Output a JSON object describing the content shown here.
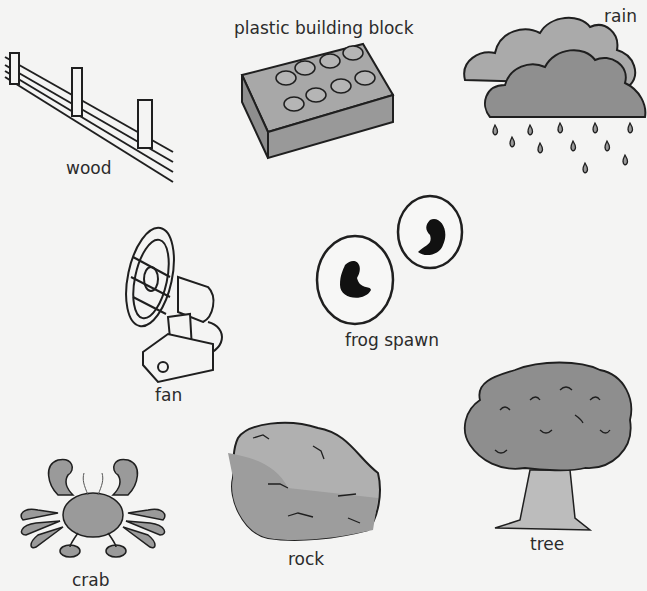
{
  "items": [
    {
      "id": "wood",
      "label": "wood"
    },
    {
      "id": "plastic-building-block",
      "label": "plastic building block"
    },
    {
      "id": "rain",
      "label": "rain"
    },
    {
      "id": "fan",
      "label": "fan"
    },
    {
      "id": "frog-spawn",
      "label": "frog spawn"
    },
    {
      "id": "crab",
      "label": "crab"
    },
    {
      "id": "rock",
      "label": "rock"
    },
    {
      "id": "tree",
      "label": "tree"
    }
  ],
  "colors": {
    "background": "#f4f4f3",
    "outline": "#1f1f1f",
    "grey_fill": "#9d9d9d",
    "light_fill": "#c4c4c4"
  }
}
